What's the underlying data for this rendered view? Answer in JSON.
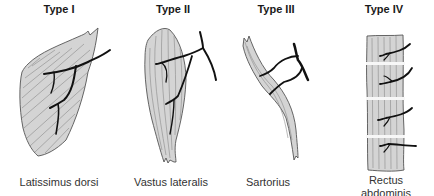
{
  "diagram": {
    "panels": [
      {
        "id": "type-1",
        "title": "Type I",
        "caption": "Latissimus dorsi"
      },
      {
        "id": "type-2",
        "title": "Type II",
        "caption": "Vastus lateralis"
      },
      {
        "id": "type-3",
        "title": "Type III",
        "caption": "Sartorius"
      },
      {
        "id": "type-4",
        "title": "Type IV",
        "caption_line1": "Rectus",
        "caption_line2": "abdominis"
      }
    ]
  }
}
